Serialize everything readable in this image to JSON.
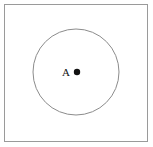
{
  "figure": {
    "kind": "geometry-diagram",
    "width": 153,
    "height": 147,
    "background_color": "#ffffff"
  },
  "frame": {
    "name": "outer-border",
    "x": 4.5,
    "y": 4.5,
    "width": 143,
    "height": 137,
    "stroke_color": "#9a9a9a",
    "stroke_width": 1,
    "fill": "none"
  },
  "circle": {
    "name": "main-circle",
    "center_x": 76,
    "center_y": 72,
    "radius": 43,
    "stroke_color": "#8c8c8c",
    "stroke_width": 1,
    "fill": "none"
  },
  "center_point": {
    "name": "center-point-A",
    "x": 77,
    "y": 72,
    "radius": 3.2,
    "fill_color": "#121212"
  },
  "label": {
    "name": "point-label-A",
    "text": "A",
    "x": 66,
    "y": 76,
    "font_size": 11,
    "color": "#121212"
  }
}
